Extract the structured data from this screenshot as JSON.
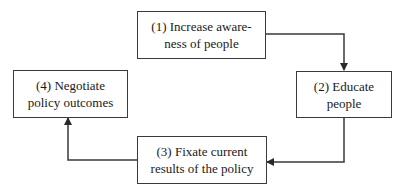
{
  "diagram": {
    "type": "cycle-flowchart",
    "nodes": [
      {
        "id": "1",
        "line1": "(1) Increase aware-",
        "line2": "ness of people"
      },
      {
        "id": "2",
        "line1": "(2) Educate",
        "line2": "people"
      },
      {
        "id": "3",
        "line1": "(3) Fixate current",
        "line2": "results of the policy"
      },
      {
        "id": "4",
        "line1": "(4) Negotiate",
        "line2": "policy outcomes"
      }
    ],
    "edges": [
      {
        "from": "1",
        "to": "2"
      },
      {
        "from": "2",
        "to": "3"
      },
      {
        "from": "3",
        "to": "4"
      }
    ],
    "colors": {
      "stroke": "#3a3a3a",
      "text": "#1a1a1a",
      "background": "#ffffff"
    }
  }
}
